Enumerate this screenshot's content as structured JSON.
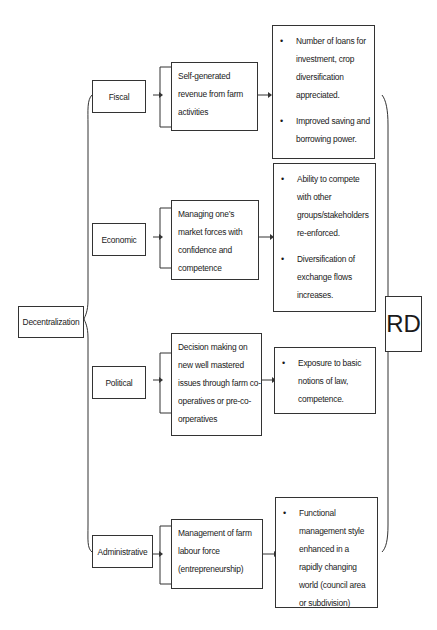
{
  "diagram": {
    "root": {
      "label": "Decentralization"
    },
    "target": {
      "label": "RD"
    },
    "branches": [
      {
        "category": "Fiscal",
        "description": "Self-generated revenue from farm activities",
        "outcomes": [
          "Number of loans for investment, crop diversification appreciated.",
          "Improved saving and borrowing power."
        ]
      },
      {
        "category": "Economic",
        "description": "Managing one’s market forces with confidence and competence",
        "outcomes": [
          "Ability to compete with other groups/stakeholders re-enforced.",
          "Diversification of exchange flows increases."
        ]
      },
      {
        "category": "Political",
        "description": "Decision making on new well mastered issues through farm co-operatives or pre-co-orperatives",
        "outcomes": [
          "Exposure to basic notions of law, competence."
        ]
      },
      {
        "category": "Administrative",
        "description": "Management of farm labour force (entrepreneurship)",
        "outcomes": [
          "Functional management style enhanced in a rapidly changing world (council area or subdivision)"
        ]
      }
    ],
    "colors": {
      "line": "#333333",
      "background": "#ffffff",
      "text": "#1a1a1a"
    }
  }
}
